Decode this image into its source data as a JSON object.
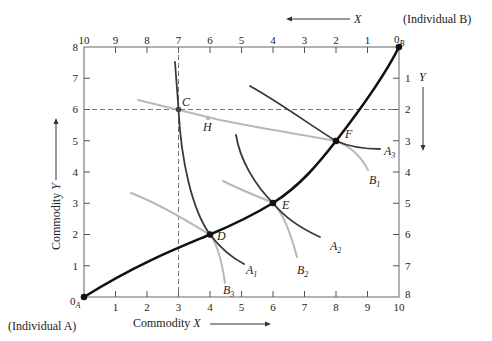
{
  "diagram": {
    "type": "edgeworth-box",
    "top_label": "(Individual B)",
    "bottom_left_label": "(Individual A)",
    "x_axis_title": "Commodity",
    "x_axis_var": "X",
    "y_axis_title": "Commodity",
    "y_axis_var": "Y",
    "top_arrow_var": "X",
    "right_arrow_var": "Y",
    "origin_a": "0",
    "origin_a_sub": "A",
    "origin_b": "0",
    "origin_b_sub": "B",
    "bottom_ticks": [
      "1",
      "2",
      "3",
      "4",
      "5",
      "6",
      "7",
      "8",
      "9",
      "10"
    ],
    "left_ticks": [
      "1",
      "2",
      "3",
      "4",
      "5",
      "6",
      "7",
      "8"
    ],
    "top_ticks": [
      "10",
      "9",
      "8",
      "7",
      "6",
      "5",
      "4",
      "3",
      "2",
      "1"
    ],
    "right_ticks": [
      "1",
      "2",
      "3",
      "4",
      "5",
      "6",
      "7",
      "8"
    ],
    "points": {
      "C": "C",
      "D": "D",
      "E": "E",
      "F": "F",
      "H": "H"
    },
    "curves": {
      "A1": {
        "base": "A",
        "sub": "1"
      },
      "A2": {
        "base": "A",
        "sub": "2"
      },
      "A3": {
        "base": "A",
        "sub": "3"
      },
      "B1": {
        "base": "B",
        "sub": "1"
      },
      "B2": {
        "base": "B",
        "sub": "2"
      },
      "B3": {
        "base": "B",
        "sub": "3"
      }
    },
    "colors": {
      "contract_curve": "#111111",
      "a_indifference": "#3a3a3a",
      "b_indifference": "#b5b5b5",
      "dashed": "#555555",
      "frame": "#555555"
    },
    "box": {
      "x_units": 10,
      "y_units": 8
    },
    "contract_curve_points_A_coords": [
      [
        0,
        0
      ],
      [
        4,
        2
      ],
      [
        6,
        3
      ],
      [
        8,
        5
      ],
      [
        10,
        8
      ]
    ],
    "initial_allocation_C": [
      3,
      6
    ],
    "point_H": [
      4,
      5.7
    ]
  }
}
